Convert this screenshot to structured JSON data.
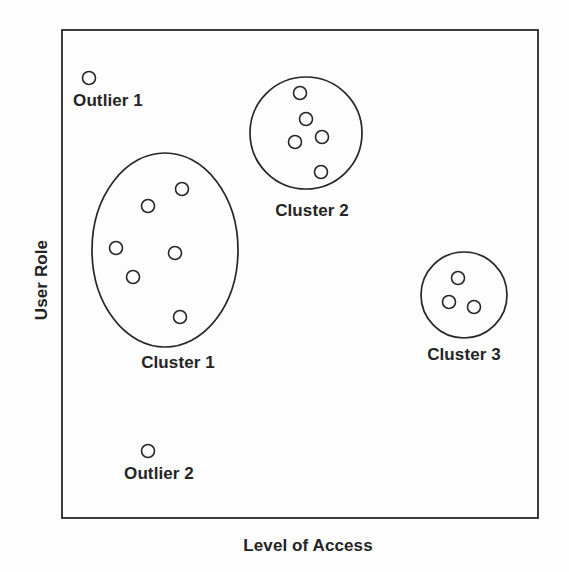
{
  "figure": {
    "background_color": "#fdfdfd",
    "stroke_color": "#262626",
    "text_color": "#242424",
    "axes": {
      "x_label": "Level of Access",
      "y_label": "User Role",
      "frame": {
        "left": 62,
        "top": 30,
        "right": 538,
        "bottom": 518
      }
    }
  },
  "chart_data": {
    "type": "scatter",
    "title": "",
    "xlabel": "Level of Access",
    "ylabel": "User Role",
    "xlim": [
      62,
      538
    ],
    "ylim": [
      518,
      30
    ],
    "grid": false,
    "legend": "none",
    "marker": {
      "shape": "circle",
      "radius": 6.5,
      "fill": "none",
      "stroke": "#262626",
      "stroke_width": 1.6
    },
    "groups": [
      {
        "name": "Cluster 1",
        "kind": "cluster",
        "label": "Cluster 1",
        "label_position": {
          "x": 178,
          "y": 363
        },
        "boundary": {
          "shape": "ellipse",
          "cx": 165,
          "cy": 250,
          "rx": 73,
          "ry": 97
        },
        "points": [
          {
            "x": 182,
            "y": 189
          },
          {
            "x": 148,
            "y": 206
          },
          {
            "x": 116,
            "y": 248
          },
          {
            "x": 175,
            "y": 253
          },
          {
            "x": 133,
            "y": 277
          },
          {
            "x": 180,
            "y": 317
          }
        ]
      },
      {
        "name": "Cluster 2",
        "kind": "cluster",
        "label": "Cluster 2",
        "label_position": {
          "x": 312,
          "y": 211
        },
        "boundary": {
          "shape": "circle",
          "cx": 306,
          "cy": 133,
          "rx": 56,
          "ry": 56
        },
        "points": [
          {
            "x": 300,
            "y": 93
          },
          {
            "x": 306,
            "y": 119
          },
          {
            "x": 322,
            "y": 137
          },
          {
            "x": 295,
            "y": 142
          },
          {
            "x": 321,
            "y": 172
          }
        ]
      },
      {
        "name": "Cluster 3",
        "kind": "cluster",
        "label": "Cluster 3",
        "label_position": {
          "x": 464,
          "y": 355
        },
        "boundary": {
          "shape": "circle",
          "cx": 464,
          "cy": 295,
          "rx": 43,
          "ry": 43
        },
        "points": [
          {
            "x": 458,
            "y": 278
          },
          {
            "x": 449,
            "y": 302
          },
          {
            "x": 474,
            "y": 307
          }
        ]
      },
      {
        "name": "Outlier 1",
        "kind": "outlier",
        "label": "Outlier 1",
        "label_position": {
          "x": 108,
          "y": 101
        },
        "boundary": null,
        "points": [
          {
            "x": 89,
            "y": 78
          }
        ]
      },
      {
        "name": "Outlier 2",
        "kind": "outlier",
        "label": "Outlier 2",
        "label_position": {
          "x": 159,
          "y": 474
        },
        "boundary": null,
        "points": [
          {
            "x": 148,
            "y": 451
          }
        ]
      }
    ],
    "annotations": [
      {
        "text": "Cluster 1",
        "x": 178,
        "y": 363
      },
      {
        "text": "Cluster 2",
        "x": 312,
        "y": 211
      },
      {
        "text": "Cluster 3",
        "x": 464,
        "y": 355
      },
      {
        "text": "Outlier 1",
        "x": 108,
        "y": 101
      },
      {
        "text": "Outlier 2",
        "x": 159,
        "y": 474
      }
    ],
    "summary": {
      "cluster_count": 3,
      "outlier_count": 2,
      "total_points": 16
    }
  }
}
